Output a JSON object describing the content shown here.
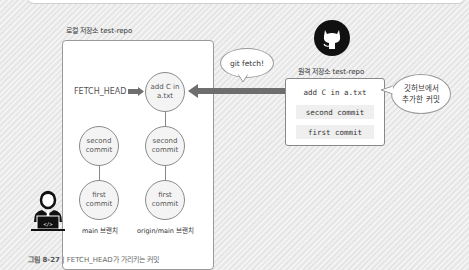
{
  "local_repo": {
    "label": "로컬 저장소 test-repo",
    "fetch_head_label": "FETCH_HEAD",
    "main_branch": {
      "commits": [
        "second commit",
        "first commit"
      ],
      "label": "main 브랜치"
    },
    "origin_main_branch": {
      "commits": [
        "add C in a.txt",
        "second commit",
        "first commit"
      ],
      "label": "origin/main 브랜치"
    }
  },
  "fetch_bubble": "git fetch!",
  "remote_repo": {
    "label": "원격 저장소 test-repo",
    "commits": [
      "add C in a.txt",
      "second commit",
      "first commit"
    ],
    "note_bubble_line1": "깃허브에서",
    "note_bubble_line2": "추가한 커밋"
  },
  "caption": {
    "number": "그림 8-27",
    "separator": "|",
    "text": "FETCH_HEAD가 가리키는 커밋"
  },
  "colors": {
    "arrow": "#6e6e6e",
    "circle_fill": "#f4f4f4",
    "box_border": "#9a9a9a"
  }
}
